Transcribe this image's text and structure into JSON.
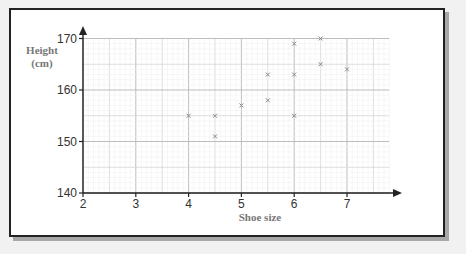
{
  "chart_data": {
    "type": "scatter",
    "title": "",
    "xlabel": "Shoe size",
    "ylabel": "Height (cm)",
    "ylabel_lines": [
      "Height",
      "(cm)"
    ],
    "xlim": [
      2,
      7.8
    ],
    "ylim": [
      140,
      170
    ],
    "xticks": [
      "2",
      "3",
      "4",
      "5",
      "6",
      "7"
    ],
    "yticks": [
      "140",
      "150",
      "160",
      "170"
    ],
    "grid": true,
    "marker": "x",
    "points": [
      {
        "x": 4,
        "y": 155
      },
      {
        "x": 4.5,
        "y": 155
      },
      {
        "x": 4.5,
        "y": 151
      },
      {
        "x": 5,
        "y": 157
      },
      {
        "x": 5.5,
        "y": 163
      },
      {
        "x": 5.5,
        "y": 158
      },
      {
        "x": 6,
        "y": 169
      },
      {
        "x": 6,
        "y": 163
      },
      {
        "x": 6,
        "y": 155
      },
      {
        "x": 6.5,
        "y": 170
      },
      {
        "x": 6.5,
        "y": 165
      },
      {
        "x": 7,
        "y": 164
      }
    ]
  }
}
